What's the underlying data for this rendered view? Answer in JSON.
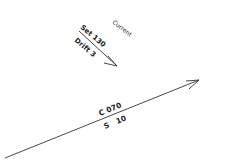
{
  "diagram": {
    "current": {
      "label": "Current",
      "set_label": "Set 130",
      "drift_label": "Drift 3"
    },
    "course": {
      "course_label": "C 070",
      "speed_label": "S   10"
    },
    "colors": {
      "line": "#333333",
      "text": "#222222",
      "background": "#ffffff"
    }
  }
}
